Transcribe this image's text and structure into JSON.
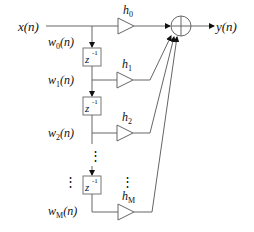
{
  "diagram": {
    "title": "",
    "input_label": "x(n)",
    "output_label": "y(n)",
    "taps": [
      {
        "signal": "w",
        "signal_sub": "0",
        "signal_suffix": "(n)",
        "gain": "h",
        "gain_sub": "0"
      },
      {
        "signal": "w",
        "signal_sub": "1",
        "signal_suffix": "(n)",
        "gain": "h",
        "gain_sub": "1"
      },
      {
        "signal": "w",
        "signal_sub": "2",
        "signal_suffix": "(n)",
        "gain": "h",
        "gain_sub": "2"
      },
      {
        "signal": "w",
        "signal_sub": "M",
        "signal_suffix": "(n)",
        "gain": "h",
        "gain_sub": "M"
      }
    ],
    "delay": {
      "base": "z",
      "exponent": "-1"
    },
    "ellipsis": "⋮",
    "summer_symbol": "plus-circle",
    "colors": {
      "line": "#666666",
      "text": "#111111",
      "background": "#ffffff"
    }
  }
}
